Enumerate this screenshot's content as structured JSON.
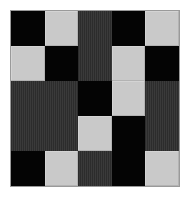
{
  "figure": {
    "kind": "texture-grid",
    "width_px": 190,
    "height_px": 197,
    "background_color": "#ffffff",
    "margin_px": 10
  },
  "frame": {
    "border_color": "#9a9a9a",
    "border_width_px": 1,
    "left_px": 10,
    "top_px": 10,
    "width_px": 170,
    "height_px": 177
  },
  "palette": {
    "black": "#040404",
    "light_gray": "#c9c9c9",
    "dark_gray": "#333333",
    "dark_gray_stripe_a": "#2c2c2c",
    "dark_gray_stripe_b": "#3a3a3a"
  },
  "grid": {
    "columns": 5,
    "rows": 5,
    "legend": {
      "K": "black",
      "L": "light",
      "D": "dark"
    },
    "cells": [
      [
        "K",
        "L",
        "D",
        "K",
        "L"
      ],
      [
        "L",
        "K",
        "D",
        "L",
        "K"
      ],
      [
        "D",
        "D",
        "K",
        "L",
        "D"
      ],
      [
        "D",
        "D",
        "L",
        "K",
        "D"
      ],
      [
        "K",
        "L",
        "D",
        "K",
        "L"
      ]
    ],
    "rows_detail": [
      {
        "index": 0,
        "values": [
          "K",
          "L",
          "D",
          "K",
          "L"
        ]
      },
      {
        "index": 1,
        "values": [
          "L",
          "K",
          "D",
          "L",
          "K"
        ]
      },
      {
        "index": 2,
        "values": [
          "D",
          "D",
          "K",
          "L",
          "D"
        ]
      },
      {
        "index": 3,
        "values": [
          "D",
          "D",
          "L",
          "K",
          "D"
        ]
      },
      {
        "index": 4,
        "values": [
          "K",
          "L",
          "D",
          "K",
          "L"
        ]
      }
    ]
  }
}
